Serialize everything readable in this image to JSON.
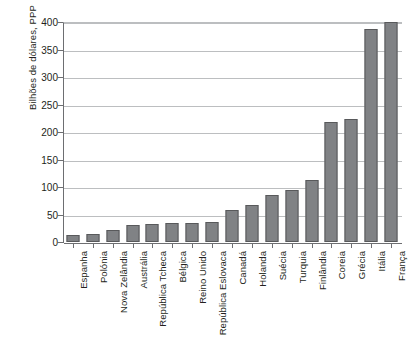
{
  "chart_data": {
    "type": "bar",
    "title": "",
    "xlabel": "",
    "ylabel": "Bilhões de dólares, PPP",
    "ylim": [
      0,
      400
    ],
    "ytick_step": 50,
    "yticks": [
      400,
      350,
      300,
      250,
      200,
      150,
      100,
      50,
      0
    ],
    "grid": "horizontal",
    "legend": "none",
    "bar_color": "#808285",
    "bar_border_color": "#58595b",
    "gridline_color": "#bcbec0",
    "axis_color": "#6d6e71",
    "categories": [
      "Espanha",
      "Polónia",
      "Nova Zelândia",
      "Austrália",
      "República Tcheca",
      "Bélgica",
      "Reino Unido",
      "República Eslovaca",
      "Canadá",
      "Holanda",
      "Suécia",
      "Turquia",
      "Finlândia",
      "Coreia",
      "Grécia",
      "Itália",
      "França"
    ],
    "values": [
      13,
      14,
      22,
      31,
      32,
      34,
      34,
      37,
      58,
      67,
      86,
      95,
      112,
      218,
      223,
      388,
      400
    ]
  }
}
